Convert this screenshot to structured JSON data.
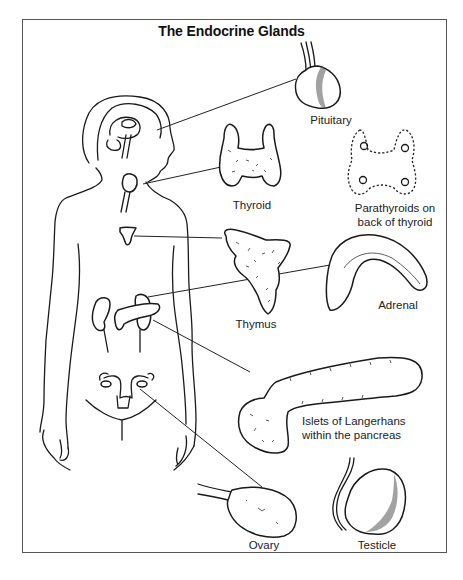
{
  "figure": {
    "title": "The Endocrine Glands",
    "labels": {
      "pituitary": "Pituitary",
      "thyroid": "Thyroid",
      "parathyroids_line1": "Parathyroids on",
      "parathyroids_line2": "back of thyroid",
      "thymus": "Thymus",
      "adrenal": "Adrenal",
      "pancreas_line1": "Islets of Langerhans",
      "pancreas_line2": "within the pancreas",
      "ovary": "Ovary",
      "testicle": "Testicle"
    }
  },
  "colors": {
    "line": "#1a1a1a",
    "frame": "#555555",
    "background": "#ffffff"
  }
}
